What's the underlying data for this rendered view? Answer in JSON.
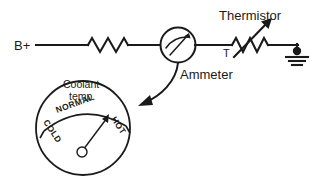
{
  "diagram": {
    "canvas": {
      "width": 319,
      "height": 177,
      "background": "#ffffff"
    },
    "stroke_color": "#1a1a1a"
  },
  "labels": {
    "supply": "B+",
    "thermistor": "Thermistor",
    "thermistor_designator": "T",
    "ammeter": "Ammeter",
    "gauge_title_line1": "Coolant",
    "gauge_title_line2": "temp.",
    "scale_cold": "COLD",
    "scale_normal": "NORMAL",
    "scale_hot": "HOT"
  },
  "components": [
    {
      "name": "supply-terminal",
      "label": "B+",
      "type": "terminal"
    },
    {
      "name": "fixed-resistor",
      "label": "",
      "type": "resistor"
    },
    {
      "name": "ammeter",
      "label": "Ammeter",
      "type": "meter"
    },
    {
      "name": "thermistor",
      "label": "Thermistor",
      "designator": "T",
      "type": "variable-resistor"
    },
    {
      "name": "ground",
      "label": "",
      "type": "ground"
    },
    {
      "name": "coolant-temp-gauge",
      "label": "Coolant temp.",
      "type": "gauge"
    }
  ],
  "gauge": {
    "title": "Coolant temp.",
    "scale_marks": [
      "COLD",
      "NORMAL",
      "HOT"
    ],
    "needle_position": "NORMAL"
  }
}
